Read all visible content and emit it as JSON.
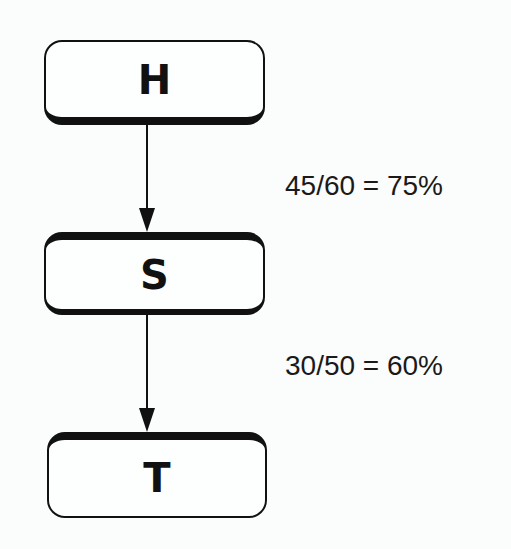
{
  "diagram": {
    "type": "flowchart",
    "nodes": [
      {
        "id": "H",
        "label": "H"
      },
      {
        "id": "S",
        "label": "S"
      },
      {
        "id": "T",
        "label": "T"
      }
    ],
    "edges": [
      {
        "from": "H",
        "to": "S",
        "label": "45/60 = 75%"
      },
      {
        "from": "S",
        "to": "T",
        "label": "30/50 = 60%"
      }
    ],
    "colors": {
      "stroke": "#111111",
      "background": "#fbfcfc"
    }
  }
}
